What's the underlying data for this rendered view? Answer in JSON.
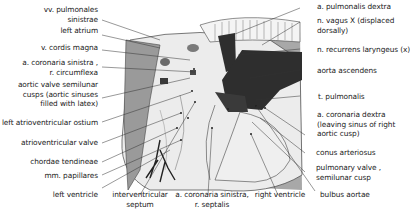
{
  "figure": {
    "colors": {
      "background": "#ffffff",
      "line": "#333333",
      "dark_vessel": "#2e2e2e",
      "grey_tissue": "#9a9a9a",
      "light_tissue": "#e6e6e6"
    }
  },
  "labels_left": [
    {
      "line1": "vv. pulmonales",
      "line2": "sinistrae"
    },
    {
      "line1": "left atrium"
    },
    {
      "line1": "v. cordis magna"
    },
    {
      "line1": "a. coronaria sinistra ,",
      "line2": "r. circumflexa"
    },
    {
      "line1": "aortic valve  semilunar",
      "line2": "cusps (aortic sinuses",
      "line3": "filled with latex)"
    },
    {
      "line1": "left atrioventricular ostium"
    },
    {
      "line1": "atrioventricular valve"
    },
    {
      "line1": "chordae tendineae"
    },
    {
      "line1": "mm. papillares"
    },
    {
      "line1": "left ventricle"
    }
  ],
  "labels_right": [
    {
      "line1": "a. pulmonalis dextra"
    },
    {
      "line1": "n. vagus X (displaced",
      "line2": "dorsally)"
    },
    {
      "line1": "n. recurrens laryngeus (x)"
    },
    {
      "line1": "aorta ascendens"
    },
    {
      "line1": "t. pulmonalis"
    },
    {
      "line1": "a. coronaria dextra",
      "line2": "(leaving sinus of right",
      "line3": "aortic cusp)"
    },
    {
      "line1": "conus arteriosus"
    },
    {
      "line1": "pulmonary valve ,",
      "line2": "semilunar cusp"
    },
    {
      "line1": "bulbus aortae"
    }
  ],
  "labels_bottom": [
    {
      "line1": "interventricular",
      "line2": "septum"
    },
    {
      "line1": "a. coronaria sinistra,",
      "line2": "r. septalis"
    },
    {
      "line1": "right ventricle"
    }
  ]
}
